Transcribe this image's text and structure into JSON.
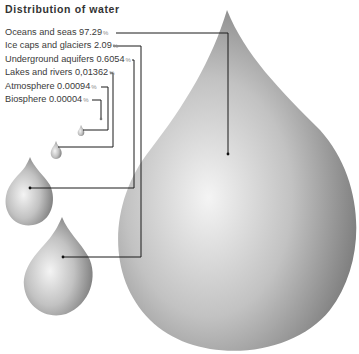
{
  "title": "Distribution of water",
  "items": [
    {
      "label": "Oceans and seas",
      "value": "97.29",
      "unit": "%"
    },
    {
      "label": "Ice caps and glaciers",
      "value": "2.09",
      "unit": "%"
    },
    {
      "label": "Underground aquifers",
      "value": "0.6054",
      "unit": "%"
    },
    {
      "label": "Lakes and rivers",
      "value": "0,01362",
      "unit": "%"
    },
    {
      "label": "Atmosphere",
      "value": "0.00094",
      "unit": "%"
    },
    {
      "label": "Biosphere",
      "value": "0.00004",
      "unit": "%"
    }
  ],
  "colors": {
    "drop_light": "#f2f2f2",
    "drop_mid": "#b8b8b8",
    "drop_dark": "#6e6e6e",
    "line": "#1a1a1a"
  }
}
